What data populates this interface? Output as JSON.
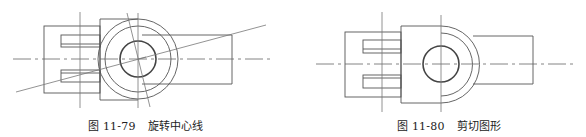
{
  "figures": [
    {
      "id": "fig-11-79",
      "caption_number": "图 11-79",
      "caption_title": "旋转中心线",
      "description": "Mechanical part drawing with center lines rotated about the circle center"
    },
    {
      "id": "fig-11-80",
      "caption_number": "图 11-80",
      "caption_title": "剪切图形",
      "description": "Mechanical part drawing after trimming (half circles removed on the left)"
    }
  ],
  "colors": {
    "line": "#555555",
    "background": "#ffffff",
    "caption_text": "#222222"
  }
}
